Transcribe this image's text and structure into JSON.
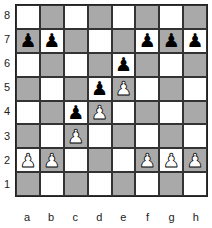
{
  "board": {
    "ranks": [
      "8",
      "7",
      "6",
      "5",
      "4",
      "3",
      "2",
      "1"
    ],
    "files": [
      "a",
      "b",
      "c",
      "d",
      "e",
      "f",
      "g",
      "h"
    ],
    "colors": {
      "light": "#ffffff",
      "dark": "#a9a9a9"
    },
    "pieces": [
      {
        "square": "a7",
        "color": "black",
        "type": "pawn",
        "glyph": "♟"
      },
      {
        "square": "b7",
        "color": "black",
        "type": "pawn",
        "glyph": "♟"
      },
      {
        "square": "f7",
        "color": "black",
        "type": "pawn",
        "glyph": "♟"
      },
      {
        "square": "g7",
        "color": "black",
        "type": "pawn",
        "glyph": "♟"
      },
      {
        "square": "h7",
        "color": "black",
        "type": "pawn",
        "glyph": "♟"
      },
      {
        "square": "e6",
        "color": "black",
        "type": "pawn",
        "glyph": "♟"
      },
      {
        "square": "d5",
        "color": "black",
        "type": "pawn",
        "glyph": "♟"
      },
      {
        "square": "c4",
        "color": "black",
        "type": "pawn",
        "glyph": "♟"
      },
      {
        "square": "e5",
        "color": "white",
        "type": "pawn",
        "glyph": "♟"
      },
      {
        "square": "d4",
        "color": "white",
        "type": "pawn",
        "glyph": "♟"
      },
      {
        "square": "c3",
        "color": "white",
        "type": "pawn",
        "glyph": "♟"
      },
      {
        "square": "a2",
        "color": "white",
        "type": "pawn",
        "glyph": "♟"
      },
      {
        "square": "b2",
        "color": "white",
        "type": "pawn",
        "glyph": "♟"
      },
      {
        "square": "f2",
        "color": "white",
        "type": "pawn",
        "glyph": "♟"
      },
      {
        "square": "g2",
        "color": "white",
        "type": "pawn",
        "glyph": "♟"
      },
      {
        "square": "h2",
        "color": "white",
        "type": "pawn",
        "glyph": "♟"
      }
    ]
  }
}
